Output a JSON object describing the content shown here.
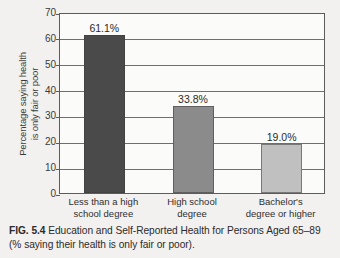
{
  "chart_data": {
    "type": "bar",
    "title": "",
    "categories": [
      "Less than a high school degree",
      "High school degree",
      "Bachelor's degree or higher"
    ],
    "category_lines": [
      [
        "Less than a high",
        "school degree"
      ],
      [
        "High school",
        "degree"
      ],
      [
        "Bachelor's",
        "degree or higher"
      ]
    ],
    "values": [
      61.1,
      33.8,
      19.0
    ],
    "value_labels": [
      "61.1%",
      "33.8%",
      "19.0%"
    ],
    "xlabel": "",
    "ylabel": "Percentage saying health is only fair or poor",
    "ylabel_lines": [
      "Percentage saying health",
      "is only fair or poor"
    ],
    "ylim": [
      0,
      70
    ],
    "ytick_values": [
      0,
      10,
      20,
      30,
      40,
      50,
      60,
      70
    ],
    "ytick_labels": [
      "0",
      "10",
      "20",
      "30",
      "40",
      "50",
      "60",
      "70"
    ],
    "grid": true,
    "legend": false,
    "bar_colors": [
      "#4a4a4a",
      "#8b8b8b",
      "#c0c0c0"
    ],
    "axis_color": "#5c5c5c",
    "plot_background": "#fbfbfa"
  },
  "caption": {
    "figure_number": "FIG. 5.4",
    "text": "Education and Self-Reported Health for Persons Aged 65–89 (% saying their health is only fair or poor)."
  }
}
